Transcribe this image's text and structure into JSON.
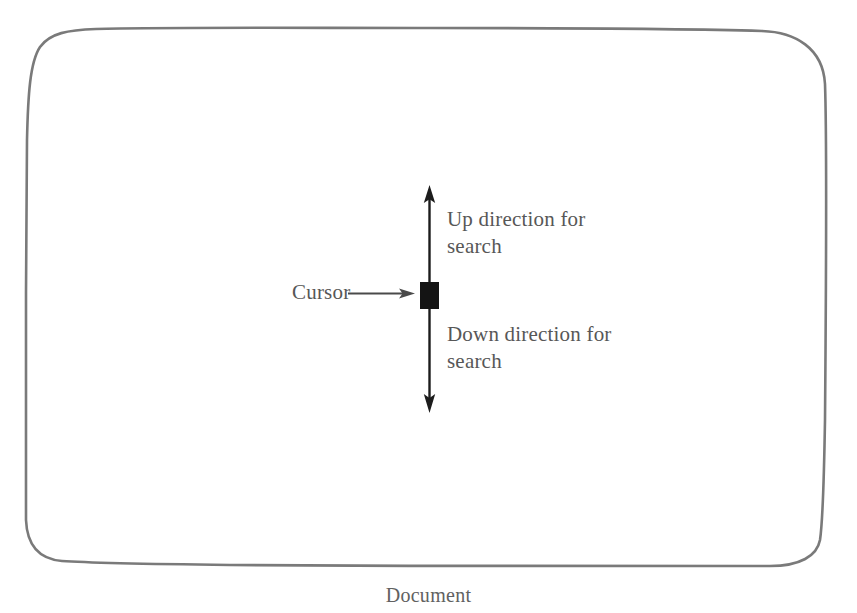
{
  "figure": {
    "caption": "Document",
    "document_outline": {
      "shape": "rounded-rectangle",
      "stroke_color": "#7a7a7a",
      "stroke_width": 2.6,
      "bounds": {
        "left": 26,
        "top": 28,
        "right": 826,
        "bottom": 566
      }
    },
    "annotations": {
      "up_direction_label": "Up direction for\nsearch",
      "down_direction_label": "Down direction for\nsearch",
      "cursor_label": "Cursor"
    },
    "cursor": {
      "name": "text-cursor-block",
      "color": "#141414",
      "x": 420,
      "y": 282,
      "width": 19,
      "height": 27
    },
    "arrows": {
      "vertical_search_axis": {
        "color": "#1c1c1c",
        "x": 429,
        "top_tip_y": 186,
        "bottom_tip_y": 412,
        "double_headed": true
      },
      "cursor_pointer": {
        "color": "#4a4a4a",
        "from_x": 348,
        "to_x": 414,
        "y": 294,
        "double_headed": false
      }
    },
    "text_color": "#575757",
    "background_color": "#ffffff"
  }
}
